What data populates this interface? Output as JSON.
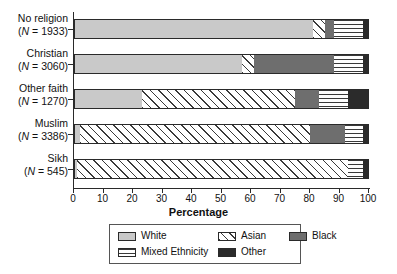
{
  "chart_data": {
    "type": "bar",
    "orientation": "horizontal",
    "stacked": true,
    "title": "",
    "xlabel": "Percentage",
    "ylabel": "",
    "xlim": [
      0,
      100
    ],
    "xticks": [
      0,
      10,
      20,
      30,
      40,
      50,
      60,
      70,
      80,
      90,
      100
    ],
    "grid": false,
    "legend_position": "bottom",
    "categories": [
      {
        "label": "No religion",
        "n_label": "(N = 1933)",
        "n": 1933
      },
      {
        "label": "Christian",
        "n_label": "(N = 3060)",
        "n": 3060
      },
      {
        "label": "Other faith",
        "n_label": "(N = 1270)",
        "n": 1270
      },
      {
        "label": "Muslim",
        "n_label": "(N = 3386)",
        "n": 3386
      },
      {
        "label": "Sikh",
        "n_label": "(N = 545)",
        "n": 545
      }
    ],
    "series": [
      {
        "name": "White",
        "key": "white",
        "values": [
          81,
          57,
          23,
          2,
          1
        ]
      },
      {
        "name": "Asian",
        "key": "asian",
        "values": [
          4,
          4,
          52,
          78,
          92
        ]
      },
      {
        "name": "Black",
        "key": "black",
        "values": [
          3,
          27,
          8,
          12,
          0
        ]
      },
      {
        "name": "Mixed Ethnicity",
        "key": "mixed",
        "values": [
          10,
          10,
          10,
          6,
          5
        ]
      },
      {
        "name": "Other",
        "key": "other",
        "values": [
          2,
          2,
          7,
          2,
          2
        ]
      }
    ],
    "legend_entries": [
      {
        "name": "White",
        "key": "white"
      },
      {
        "name": "Mixed Ethnicity",
        "key": "mixed"
      },
      {
        "name": "Asian",
        "key": "asian"
      },
      {
        "name": "Other",
        "key": "other"
      },
      {
        "name": "Black",
        "key": "black"
      }
    ]
  }
}
